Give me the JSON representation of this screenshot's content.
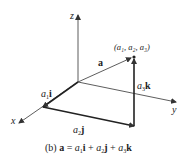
{
  "diagram": {
    "axes": {
      "x_label": "x",
      "y_label": "y",
      "z_label": "z"
    },
    "vector_label": "a",
    "point_label": "(a₁, a₂, a₃)",
    "components": {
      "i_label_coef": "a",
      "i_label_sub": "1",
      "i_label_unit": "i",
      "j_label_coef": "a",
      "j_label_sub": "2",
      "j_label_unit": "j",
      "k_label_coef": "a",
      "k_label_sub": "3",
      "k_label_unit": "k"
    },
    "caption": {
      "prefix": "(b) ",
      "a": "a",
      "eq": " = ",
      "t1c": "a",
      "t1s": "1",
      "t1u": "i",
      "plus1": " + ",
      "t2c": "a",
      "t2s": "2",
      "t2u": "j",
      "plus2": " + ",
      "t3c": "a",
      "t3s": "3",
      "t3u": "k"
    },
    "colors": {
      "line": "#333333",
      "text": "#222222"
    }
  }
}
